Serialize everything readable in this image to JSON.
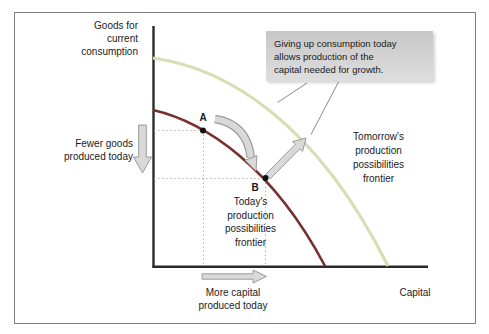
{
  "figure": {
    "y_axis_label": "Goods for\ncurrent\nconsumption",
    "x_axis_label": "Capital",
    "today_frontier_label": "Today's\nproduction\npossibilities\nfrontier",
    "tomorrow_frontier_label": "Tomorrow's\nproduction\npossibilities\nfrontier",
    "fewer_goods_label": "Fewer goods\nproduced today",
    "more_capital_label": "More capital\nproduced today",
    "callout_text": "Giving up consumption today\nallows production of the\ncapital needed for growth.",
    "point_a_label": "A",
    "point_b_label": "B"
  },
  "colors": {
    "today_curve": "#7a3030",
    "tomorrow_curve": "#d9ddb4",
    "axis": "#2a2a2a",
    "arrow_fill": "#d9d9d9",
    "arrow_stroke": "#9b9b9b",
    "callout_bg_top": "#c7c7c7",
    "callout_bg_bottom": "#dedede",
    "dotted_line": "#b5b5b5",
    "leader_line": "#8a8a8a",
    "border": "#7d7d7d",
    "text": "#1a1a1a"
  }
}
